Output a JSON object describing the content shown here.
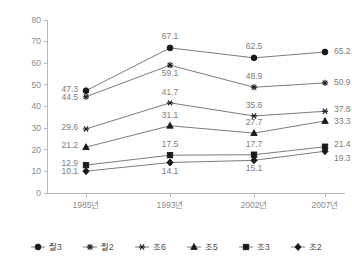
{
  "chart_data": {
    "type": "line",
    "title": "",
    "subtitle": "",
    "xlabel": "",
    "ylabel": "",
    "ylim": [
      0,
      80
    ],
    "ytick_step": 10,
    "grid": false,
    "legend_position": "bottom",
    "categories": [
      "1985년",
      "1993년",
      "2002년",
      "2007년"
    ],
    "ytick_labels": [
      "0",
      "10",
      "20",
      "30",
      "40",
      "50",
      "60",
      "70",
      "80"
    ],
    "series": [
      {
        "name": "줱3",
        "marker": "circle",
        "color": "#1a1a1a",
        "values": [
          47.3,
          67.1,
          62.5,
          65.2
        ],
        "labels": [
          "47.3",
          "67.1",
          "62.5",
          "65.2"
        ]
      },
      {
        "name": "줱2",
        "marker": "asterisk",
        "color": "#1a1a1a",
        "values": [
          44.5,
          59.1,
          48.9,
          50.9
        ],
        "labels": [
          "44.5",
          "59.1",
          "48.9",
          "50.9"
        ]
      },
      {
        "name": "초6",
        "marker": "star",
        "color": "#1a1a1a",
        "values": [
          29.6,
          41.7,
          35.6,
          37.8
        ],
        "labels": [
          "29.6",
          "41.7",
          "35.6",
          "37.8"
        ]
      },
      {
        "name": "초5",
        "marker": "triangle",
        "color": "#1a1a1a",
        "values": [
          21.2,
          31.1,
          27.7,
          33.3
        ],
        "labels": [
          "21.2",
          "31.1",
          "27.7",
          "33.3"
        ]
      },
      {
        "name": "초3",
        "marker": "square",
        "color": "#1a1a1a",
        "values": [
          12.9,
          17.5,
          17.7,
          21.4
        ],
        "labels": [
          "12.9",
          "17.5",
          "17.7",
          "21.4"
        ]
      },
      {
        "name": "초2",
        "marker": "diamond",
        "color": "#1a1a1a",
        "values": [
          10.1,
          14.1,
          15.1,
          19.3
        ],
        "labels": [
          "10.1",
          "14.1",
          "15.1",
          "19.3"
        ]
      }
    ]
  },
  "legend": {
    "items": [
      {
        "label": "줱3",
        "marker": "circle"
      },
      {
        "label": "줱2",
        "marker": "asterisk"
      },
      {
        "label": "초6",
        "marker": "star"
      },
      {
        "label": "초5",
        "marker": "triangle"
      },
      {
        "label": "초3",
        "marker": "square"
      },
      {
        "label": "초2",
        "marker": "diamond"
      }
    ]
  },
  "colors": {
    "axis": "#b9b9b9",
    "line": "#6d6d6d",
    "marker": "#1a1a1a",
    "label_text": "#7d7d7d",
    "tick_text": "#8a8a8a",
    "background": "#ffffff"
  }
}
